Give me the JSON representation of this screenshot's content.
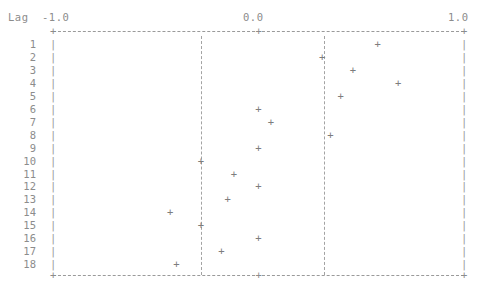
{
  "header": {
    "lag_title": "Lag",
    "tick_left": "-1.0",
    "tick_mid": "0.0",
    "tick_right": "1.0",
    "axis_tick_glyph": "+",
    "row_bar_glyph": "|",
    "marker_glyph": "+"
  },
  "chart_data": {
    "type": "scatter",
    "title": "Lag",
    "xlabel": "",
    "ylabel": "Lag",
    "xlim": [
      -1.0,
      1.0
    ],
    "xticks": [
      -1.0,
      0.0,
      1.0
    ],
    "xtick_labels": [
      "-1.0",
      "0.0",
      "1.0"
    ],
    "grid": false,
    "legend": "none",
    "orientation": "horizontal",
    "marker": "+",
    "reference_lines": [
      -0.28,
      0.32
    ],
    "categories": [
      1,
      2,
      3,
      4,
      5,
      6,
      7,
      8,
      9,
      10,
      11,
      12,
      13,
      14,
      15,
      16,
      17,
      18
    ],
    "values": [
      0.58,
      0.31,
      0.46,
      0.68,
      0.4,
      0.0,
      0.06,
      0.35,
      0.0,
      -0.28,
      -0.12,
      0.0,
      -0.15,
      -0.43,
      -0.28,
      0.0,
      -0.18,
      -0.4
    ],
    "row_labels": [
      "1",
      "2",
      "3",
      "4",
      "5",
      "6",
      "7",
      "8",
      "9",
      "10",
      "11",
      "12",
      "13",
      "14",
      "15",
      "16",
      "17",
      "18"
    ]
  }
}
